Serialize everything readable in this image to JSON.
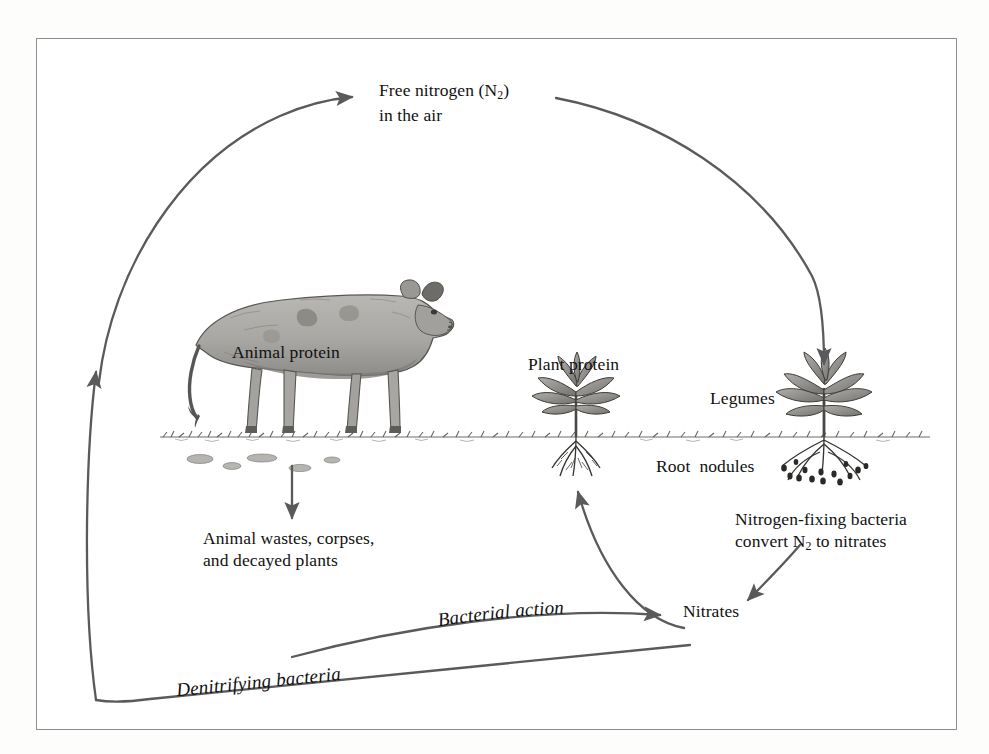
{
  "figure": {
    "type": "nitrogen-cycle-diagram",
    "frame_color": "#8e8e90",
    "background": "#ffffff",
    "line_color": "#5a5a5c"
  },
  "labels": {
    "free_nitrogen_line1": "Free nitrogen (N",
    "free_nitrogen_sub": "2",
    "free_nitrogen_line1_end": ")",
    "free_nitrogen_line2": "in the air",
    "animal_protein": "Animal protein",
    "plant_protein": "Plant protein",
    "legumes": "Legumes",
    "root_nodules": "Root  nodules",
    "nfix_line1": "Nitrogen-fixing bacteria",
    "nfix_line2_pre": "convert N",
    "nfix_line2_sub": "2",
    "nfix_line2_post": " to nitrates",
    "animal_wastes_line1": "Animal wastes, corpses,",
    "animal_wastes_line2": "and decayed plants",
    "nitrates": "Nitrates",
    "bacterial_action": "Bacterial action",
    "denitrifying_bacteria": "Denitrifying bacteria"
  },
  "illustrations": {
    "cow": "animal-cow-illustration",
    "plant": "plant-protein-illustration",
    "legume": "legume-plant-illustration",
    "ground": "ground-line"
  },
  "flows": [
    {
      "name": "nitrogen-to-legumes",
      "from": "Free nitrogen (N2) in the air",
      "to": "Legumes"
    },
    {
      "name": "animal-protein-to-wastes",
      "from": "Animal protein",
      "to": "Animal wastes, corpses, and decayed plants"
    },
    {
      "name": "wastes-to-nitrates",
      "from": "Animal wastes, corpses, and decayed plants",
      "to": "Nitrates",
      "label": "Bacterial action"
    },
    {
      "name": "nitrates-to-free-nitrogen",
      "from": "Nitrates",
      "to": "Free nitrogen (N2) in the air",
      "label": "Denitrifying bacteria"
    },
    {
      "name": "nitrates-to-plant-protein",
      "from": "Nitrates",
      "to": "Plant protein"
    },
    {
      "name": "nodules-to-nitrates",
      "from": "Nitrogen-fixing bacteria convert N2 to nitrates",
      "to": "Nitrates"
    }
  ]
}
